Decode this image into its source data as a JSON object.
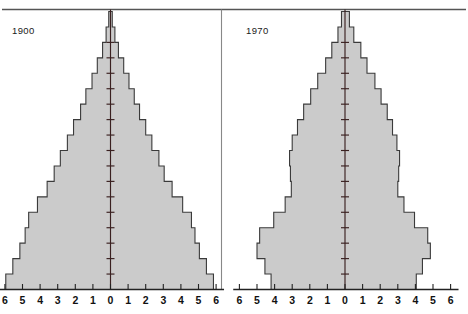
{
  "figure": {
    "title": "",
    "background_color": "#ffffff",
    "frame_color": "#555555",
    "divider_color": "#888888"
  },
  "panels": [
    {
      "key": "p1900",
      "label": "1900"
    },
    {
      "key": "p1970",
      "label": "1970"
    }
  ],
  "axis": {
    "tick_labels": [
      "6",
      "5",
      "4",
      "3",
      "2",
      "1",
      "0",
      "1",
      "2",
      "3",
      "4",
      "5",
      "6"
    ],
    "tick_values": [
      -6,
      -5,
      -4,
      -3,
      -2,
      -1,
      0,
      1,
      2,
      3,
      4,
      5,
      6
    ],
    "min": -6,
    "max": 6,
    "label": "",
    "baseline_color": "#222222",
    "center_line_color": "#3a2020"
  },
  "style": {
    "fill_color": "#cbcbcb",
    "outline_color": "#3a3a3a",
    "text_color": "#1a1a1a"
  },
  "chart_data": {
    "type": "bar",
    "subtitle": "",
    "orientation": "horizontal-pyramid",
    "xlabel": "Percent of total population",
    "ylabel": "Age group",
    "xlim": [
      -6,
      6
    ],
    "grid": false,
    "legend": null,
    "tick_labels": [
      "6",
      "5",
      "4",
      "3",
      "2",
      "1",
      "0",
      "1",
      "2",
      "3",
      "4",
      "5",
      "6"
    ],
    "note": "Each panel shows males (left of center) and females (right of center) as percent of total population, by five-year age group from youngest at bottom to oldest at top.",
    "panels": [
      {
        "name": "1900",
        "age_groups": [
          "0-4",
          "5-9",
          "10-14",
          "15-19",
          "20-24",
          "25-29",
          "30-34",
          "35-39",
          "40-44",
          "45-49",
          "50-54",
          "55-59",
          "60-64",
          "65-69",
          "70-74",
          "75-79",
          "80-84",
          "85+"
        ],
        "series": [
          {
            "name": "Male",
            "side": "left",
            "values": [
              5.95,
              5.55,
              5.15,
              4.85,
              4.65,
              4.15,
              3.6,
              3.2,
              2.85,
              2.45,
              2.1,
              1.7,
              1.4,
              1.05,
              0.75,
              0.45,
              0.25,
              0.1
            ]
          },
          {
            "name": "Female",
            "side": "right",
            "values": [
              5.85,
              5.45,
              5.05,
              4.8,
              4.6,
              4.1,
              3.5,
              3.05,
              2.75,
              2.35,
              2.0,
              1.65,
              1.35,
              1.05,
              0.75,
              0.45,
              0.25,
              0.1
            ]
          }
        ]
      },
      {
        "name": "1970",
        "age_groups": [
          "0-4",
          "5-9",
          "10-14",
          "15-19",
          "20-24",
          "25-29",
          "30-34",
          "35-39",
          "40-44",
          "45-49",
          "50-54",
          "55-59",
          "60-64",
          "65-69",
          "70-74",
          "75-79",
          "80-84",
          "85+"
        ],
        "series": [
          {
            "name": "Male",
            "side": "left",
            "values": [
              4.2,
              4.55,
              5.0,
              4.85,
              4.05,
              3.4,
              3.05,
              3.1,
              3.15,
              3.0,
              2.7,
              2.35,
              1.95,
              1.55,
              1.1,
              0.75,
              0.4,
              0.2
            ]
          },
          {
            "name": "Female",
            "side": "right",
            "values": [
              4.05,
              4.4,
              4.85,
              4.7,
              3.95,
              3.35,
              3.0,
              3.05,
              3.1,
              2.95,
              2.7,
              2.4,
              2.05,
              1.7,
              1.25,
              0.9,
              0.5,
              0.25
            ]
          }
        ]
      }
    ]
  }
}
